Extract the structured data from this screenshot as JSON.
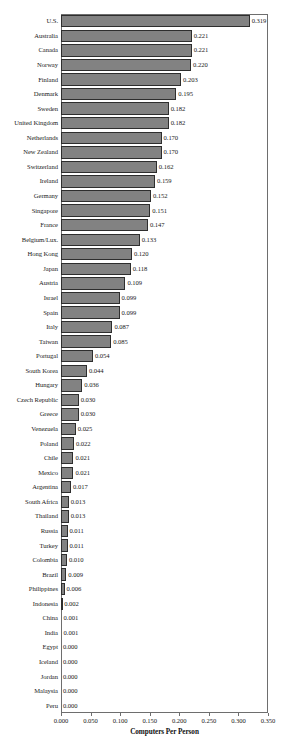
{
  "chart_data": {
    "type": "bar",
    "orientation": "horizontal",
    "title": "",
    "xlabel": "Computers Per Person",
    "ylabel": "",
    "xlim": [
      0.0,
      0.35
    ],
    "xticks": [
      "0.000",
      "0.050",
      "0.100",
      "0.150",
      "0.200",
      "0.250",
      "0.300",
      "0.350"
    ],
    "xtick_values": [
      0.0,
      0.05,
      0.1,
      0.15,
      0.2,
      0.25,
      0.3,
      0.35
    ],
    "grid": false,
    "legend": null,
    "bar_color": "#828282",
    "bar_edge_color": "#2e2e2e",
    "value_label_format": "0.000",
    "categories": [
      "U.S.",
      "Australia",
      "Canada",
      "Norway",
      "Finland",
      "Denmark",
      "Sweden",
      "United Kingdom",
      "Netherlands",
      "New Zealand",
      "Switzerland",
      "Ireland",
      "Germany",
      "Singapore",
      "France",
      "Belgium/Lux.",
      "Hong Kong",
      "Japan",
      "Austria",
      "Israel",
      "Spain",
      "Italy",
      "Taiwan",
      "Portugal",
      "South Korea",
      "Hungary",
      "Czech Republic",
      "Greece",
      "Venezuela",
      "Poland",
      "Chile",
      "Mexico",
      "Argentina",
      "South Africa",
      "Thailand",
      "Russia",
      "Turkey",
      "Colombia",
      "Brazil",
      "Philippines",
      "Indonesia",
      "China",
      "India",
      "Egypt",
      "Iceland",
      "Jordan",
      "Malaysia",
      "Peru"
    ],
    "values": [
      0.319,
      0.221,
      0.221,
      0.22,
      0.203,
      0.195,
      0.182,
      0.182,
      0.17,
      0.17,
      0.162,
      0.159,
      0.152,
      0.151,
      0.147,
      0.133,
      0.12,
      0.118,
      0.109,
      0.099,
      0.099,
      0.087,
      0.085,
      0.054,
      0.044,
      0.036,
      0.03,
      0.03,
      0.025,
      0.022,
      0.021,
      0.021,
      0.017,
      0.013,
      0.013,
      0.011,
      0.011,
      0.01,
      0.009,
      0.006,
      0.002,
      0.001,
      0.001,
      0.0,
      0.0,
      0.0,
      0.0,
      0.0
    ],
    "value_labels": [
      "0.319",
      "0.221",
      "0.221",
      "0.220",
      "0.203",
      "0.195",
      "0.182",
      "0.182",
      "0.170",
      "0.170",
      "0.162",
      "0.159",
      "0.152",
      "0.151",
      "0.147",
      "0.133",
      "0.120",
      "0.118",
      "0.109",
      "0.099",
      "0.099",
      "0.087",
      "0.085",
      "0.054",
      "0.044",
      "0.036",
      "0.030",
      "0.030",
      "0.025",
      "0.022",
      "0.021",
      "0.021",
      "0.017",
      "0.013",
      "0.013",
      "0.011",
      "0.011",
      "0.010",
      "0.009",
      "0.006",
      "0.002",
      "0.001",
      "0.001",
      "0.000",
      "0.000",
      "0.000",
      "0.000",
      "0.000"
    ]
  }
}
